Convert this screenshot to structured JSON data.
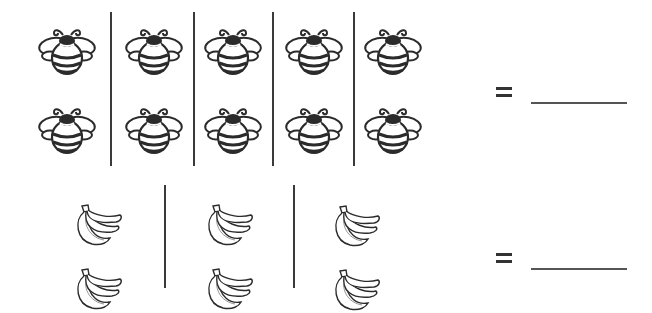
{
  "rows": [
    {
      "item": "bee",
      "groups": 5,
      "per_group": 2,
      "icon_name": "bee-icon",
      "equals": "=",
      "answer": ""
    },
    {
      "item": "banana",
      "groups": 3,
      "per_group": 2,
      "icon_name": "banana-bunch-icon",
      "equals": "=",
      "answer": ""
    }
  ],
  "colors": {
    "ink": "#333333",
    "background": "#ffffff"
  }
}
